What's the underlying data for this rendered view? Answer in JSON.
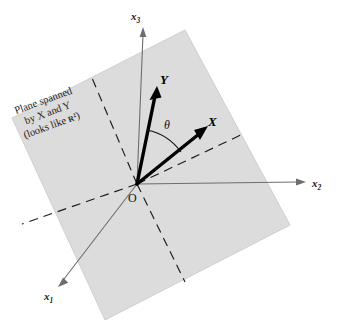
{
  "figure": {
    "background_color": "#ffffff",
    "plane_fill": "#dcdcdc",
    "plane_stroke": "#c8c8c8",
    "axis_color": "#6e6e6e",
    "vector_color": "#000000",
    "dash_color": "#1a1a1a"
  },
  "axes": [
    {
      "id": "x3",
      "name": "x",
      "subscript": "3",
      "label": "x₃",
      "direction": "up"
    },
    {
      "id": "x2",
      "name": "x",
      "subscript": "2",
      "label": "x₂",
      "direction": "right"
    },
    {
      "id": "x1",
      "name": "x",
      "subscript": "1",
      "label": "x₁",
      "direction": "down-left"
    }
  ],
  "vectors": [
    {
      "id": "Y",
      "label": "Y"
    },
    {
      "id": "X",
      "label": "X"
    }
  ],
  "angle": {
    "label": "θ",
    "between": "X and Y"
  },
  "origin": {
    "label": "O"
  },
  "annotation": {
    "line1": "Plane spanned",
    "line2": "by X and Y",
    "line3_prefix": "(looks like ",
    "line3_symbol": "R",
    "line3_exponent": "2",
    "line3_suffix": ")"
  }
}
